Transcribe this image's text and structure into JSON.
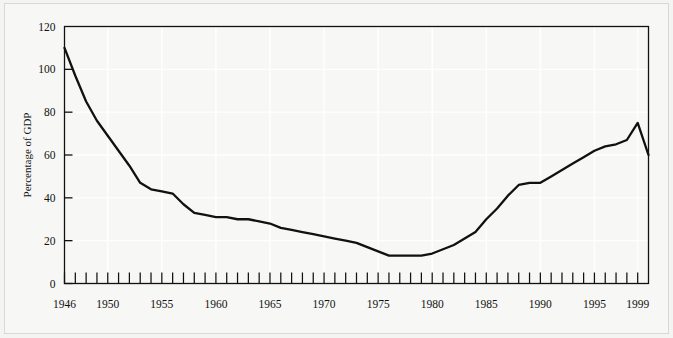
{
  "chart_data": {
    "type": "line",
    "title": "",
    "xlabel": "",
    "ylabel": "Percentage of GDP",
    "xlim": [
      1946,
      2000
    ],
    "ylim": [
      0,
      120
    ],
    "grid": true,
    "legend_position": "none",
    "ytick_labels": [
      "0",
      "20",
      "40",
      "60",
      "80",
      "100",
      "120"
    ],
    "ytick_values": [
      0,
      20,
      40,
      60,
      80,
      100,
      120
    ],
    "xtick_labels": [
      "1946",
      "1950",
      "1955",
      "1960",
      "1965",
      "1970",
      "1975",
      "1980",
      "1985",
      "1990",
      "1995",
      "1999"
    ],
    "xtick_label_values": [
      1946,
      1950,
      1955,
      1960,
      1965,
      1970,
      1975,
      1980,
      1985,
      1990,
      1995,
      1999
    ],
    "minor_tick_interval": 1,
    "line_color": "#111111",
    "series": [
      {
        "name": "Percentage of GDP",
        "x": [
          1946,
          1947,
          1948,
          1949,
          1950,
          1951,
          1952,
          1953,
          1954,
          1955,
          1956,
          1957,
          1958,
          1959,
          1960,
          1961,
          1962,
          1963,
          1964,
          1965,
          1966,
          1967,
          1968,
          1969,
          1970,
          1971,
          1972,
          1973,
          1974,
          1975,
          1976,
          1977,
          1978,
          1979,
          1980,
          1981,
          1982,
          1983,
          1984,
          1985,
          1986,
          1987,
          1988,
          1989,
          1990,
          1991,
          1992,
          1993,
          1994,
          1995,
          1996,
          1997,
          1998,
          1999,
          2000
        ],
        "values": [
          110,
          97,
          85,
          76,
          69,
          62,
          55,
          47,
          44,
          43,
          42,
          37,
          33,
          32,
          31,
          31,
          30,
          30,
          29,
          28,
          26,
          25,
          24,
          23,
          22,
          21,
          20,
          19,
          17,
          15,
          13,
          13,
          13,
          13,
          14,
          16,
          18,
          21,
          24,
          30,
          35,
          41,
          46,
          47,
          47,
          50,
          53,
          56,
          59,
          62,
          64,
          65,
          67,
          75,
          60
        ]
      }
    ]
  }
}
